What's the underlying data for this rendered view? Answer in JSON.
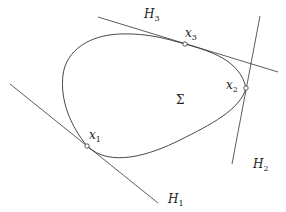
{
  "diagram": {
    "region_label": "Σ",
    "stroke_color": "#333333",
    "points": [
      {
        "name": "x",
        "sub": "1"
      },
      {
        "name": "x",
        "sub": "2"
      },
      {
        "name": "x",
        "sub": "3"
      }
    ],
    "lines": [
      {
        "name": "H",
        "sub": "1"
      },
      {
        "name": "H",
        "sub": "2"
      },
      {
        "name": "H",
        "sub": "3"
      }
    ]
  }
}
